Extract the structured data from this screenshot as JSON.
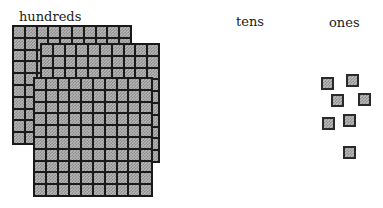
{
  "labels": {
    "hundreds": "hundreds",
    "tens": "tens",
    "ones": "ones"
  },
  "columns": [
    {
      "name": "hundreds",
      "count": 3,
      "block": "flat 10x10"
    },
    {
      "name": "tens",
      "count": 0,
      "block": "rod 1x10"
    },
    {
      "name": "ones",
      "count": 7,
      "block": "unit cube"
    }
  ],
  "represented_number": 307,
  "grid": {
    "rows": 10,
    "cols": 10
  },
  "flats": [
    {
      "left": 12,
      "top": 25,
      "size": 120
    },
    {
      "left": 40,
      "top": 43,
      "size": 120
    },
    {
      "left": 33,
      "top": 77,
      "size": 120
    }
  ],
  "units": [
    {
      "left": 321,
      "top": 77
    },
    {
      "left": 346,
      "top": 74
    },
    {
      "left": 331,
      "top": 94
    },
    {
      "left": 358,
      "top": 93
    },
    {
      "left": 322,
      "top": 117
    },
    {
      "left": 343,
      "top": 114
    },
    {
      "left": 343,
      "top": 146
    }
  ],
  "colors": {
    "block_fill": "#b8b8b8",
    "block_border": "#1a1a1a",
    "background": "#ffffff"
  }
}
